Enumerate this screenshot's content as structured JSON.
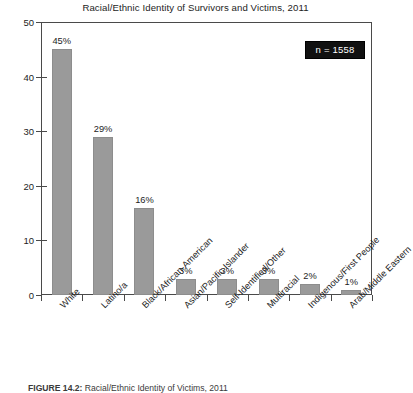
{
  "chart_data": {
    "type": "bar",
    "title": "Racial/Ethnic Identity of Survivors and Victims, 2011",
    "xlabel": "",
    "ylabel": "",
    "ylim": [
      0,
      50
    ],
    "yticks": [
      0,
      10,
      20,
      30,
      40,
      50
    ],
    "ytick_labels": [
      "0",
      "10",
      "20",
      "30",
      "40",
      "50"
    ],
    "grid": false,
    "legend": null,
    "categories": [
      "White",
      "Latino/a",
      "Black/African-American",
      "Asian/Pacific Islander",
      "Self-Identified/Other",
      "Multiracial",
      "Indigenous/First People",
      "Arab/Middle Eastern"
    ],
    "values": [
      45,
      29,
      16,
      3,
      3,
      3,
      2,
      1
    ],
    "value_labels": [
      "45%",
      "29%",
      "16%",
      "3%",
      "3%",
      "3%",
      "2%",
      "1%"
    ],
    "annotations": [
      {
        "name": "sample-size",
        "text": "n = 1558"
      }
    ],
    "colors": {
      "bar_fill": "#9a9a9a",
      "bar_edge": "#8d8d8d",
      "axis": "#4a4a4a",
      "text": "#1d1d1d",
      "annotation_bg": "#111111",
      "annotation_text": "#ffffff",
      "background": "#ffffff"
    }
  },
  "caption": {
    "label": "FIGURE 14.2:",
    "text": " Racial/Ethnic Identity of Victims, 2011"
  }
}
